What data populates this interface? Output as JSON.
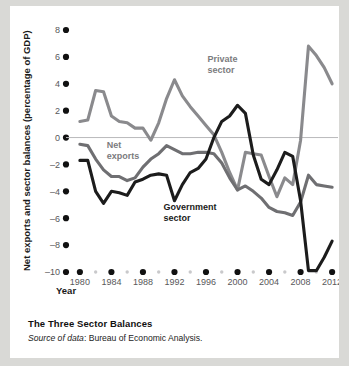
{
  "figure": {
    "caption_title": "The Three Sector Balances",
    "source_lead": "Source of data",
    "source_rest": ": Bureau of Economic Analysis."
  },
  "colors": {
    "background": "#d9d9d6",
    "card": "#ffffff",
    "private_sector": "#8a8a8d",
    "net_exports": "#6f6f72",
    "government_sector": "#1c1c1c",
    "zero_line": "#b9b9bb",
    "tick_dot": "#111111",
    "minor_tick_dot": "#c9c9cb",
    "text": "#1a1a1a"
  },
  "chart_data": {
    "type": "line",
    "title": "The Three Sector Balances",
    "xlabel": "Year",
    "ylabel": "Net exports and sector balances (percentage of GDP)",
    "xlim": [
      1979,
      2013
    ],
    "ylim": [
      -10,
      8
    ],
    "ytick_values": [
      8,
      6,
      4,
      2,
      0,
      -2,
      -4,
      -6,
      -8,
      -10
    ],
    "ytick_labels": [
      "8",
      "6",
      "4",
      "2",
      "0",
      "-2",
      "-4",
      "-6",
      "-8",
      "-10"
    ],
    "xtick_values": [
      1980,
      1984,
      1988,
      1992,
      1996,
      2000,
      2004,
      2008,
      2012
    ],
    "xtick_labels": [
      "1980",
      "1984",
      "1988",
      "1992",
      "1996",
      "2000",
      "2004",
      "2008",
      "2012"
    ],
    "xtick_minor_values": [
      1982,
      1986,
      1990,
      1994,
      1998,
      2002,
      2006,
      2010
    ],
    "grid": false,
    "zero_line": 0,
    "legend_position": "inline-annotations",
    "annotations": [
      {
        "name": "private-sector",
        "text": "Private\nsector",
        "line1": "Private",
        "line2": "sector",
        "x": 1996.2,
        "y": 5.6
      },
      {
        "name": "net-exports",
        "text": "Net\nexports",
        "line1": "Net",
        "line2": "exports",
        "x": 1983.4,
        "y": -0.8
      },
      {
        "name": "government-sector",
        "text": "Government\nsector",
        "line1": "Government",
        "line2": "sector",
        "x": 1990.6,
        "y": -5.4
      }
    ],
    "x": [
      1980,
      1981,
      1982,
      1983,
      1984,
      1985,
      1986,
      1987,
      1988,
      1989,
      1990,
      1991,
      1992,
      1993,
      1994,
      1995,
      1996,
      1997,
      1998,
      1999,
      2000,
      2001,
      2002,
      2003,
      2004,
      2005,
      2006,
      2007,
      2008,
      2009,
      2010,
      2011,
      2012
    ],
    "series": [
      {
        "name": "Private sector",
        "color": "#8a8a8d",
        "values": [
          1.2,
          1.3,
          3.5,
          3.4,
          1.6,
          1.2,
          1.1,
          0.7,
          0.7,
          -0.2,
          1.1,
          2.9,
          4.3,
          3.1,
          2.3,
          1.6,
          0.9,
          0.2,
          -1.1,
          -2.6,
          -3.9,
          -1.1,
          -1.2,
          -1.3,
          -2.9,
          -4.4,
          -3.0,
          -3.5,
          -0.2,
          6.8,
          6.1,
          5.2,
          4.0
        ]
      },
      {
        "name": "Net exports",
        "color": "#6f6f72",
        "values": [
          -0.5,
          -0.6,
          -1.6,
          -2.4,
          -2.9,
          -2.9,
          -3.2,
          -3.0,
          -2.2,
          -1.6,
          -1.2,
          -0.6,
          -0.9,
          -1.2,
          -1.2,
          -1.1,
          -1.1,
          -1.2,
          -1.9,
          -3.0,
          -3.9,
          -3.6,
          -4.0,
          -4.5,
          -5.2,
          -5.5,
          -5.6,
          -5.8,
          -4.8,
          -2.8,
          -3.5,
          -3.6,
          -3.7
        ]
      },
      {
        "name": "Government sector",
        "color": "#1c1c1c",
        "values": [
          -1.7,
          -1.7,
          -4.0,
          -4.9,
          -4.0,
          -4.1,
          -4.3,
          -3.3,
          -3.1,
          -2.8,
          -2.7,
          -2.8,
          -4.7,
          -3.5,
          -2.6,
          -2.3,
          -1.6,
          0.0,
          1.2,
          1.6,
          2.4,
          1.8,
          -1.3,
          -3.1,
          -3.5,
          -2.4,
          -1.1,
          -1.4,
          -4.7,
          -9.9,
          -9.9,
          -8.9,
          -7.7
        ]
      }
    ]
  }
}
